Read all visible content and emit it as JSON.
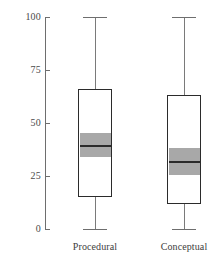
{
  "chart_data": {
    "type": "box",
    "title": "",
    "xlabel": "",
    "ylabel": "",
    "ylim": [
      0,
      100
    ],
    "grid": false,
    "legend": null,
    "categories": [
      "Procedural",
      "Conceptual"
    ],
    "y_ticks": [
      {
        "value": 100,
        "label": "100"
      },
      {
        "value": 75,
        "label": "75"
      },
      {
        "value": 50,
        "label": "50"
      },
      {
        "value": 25,
        "label": "25"
      },
      {
        "value": 0,
        "label": "0"
      }
    ],
    "boxes": [
      {
        "name": "Procedural",
        "whisker_low": 0,
        "q1": 15,
        "notch_low": 34,
        "median": 39.5,
        "notch_high": 45,
        "q3": 66,
        "whisker_high": 100
      },
      {
        "name": "Conceptual",
        "whisker_low": 0,
        "q1": 12,
        "notch_low": 25.5,
        "median": 32,
        "notch_high": 38,
        "q3": 63,
        "whisker_high": 100
      }
    ],
    "colors": {
      "box_fill": "#ffffff",
      "box_edge": "#2b2b2b",
      "notch_fill": "#a8a8a8",
      "median": "#2b2b2b",
      "whisker": "#7a7a7a",
      "axis": "#6e6e6e",
      "tick_label": "#4a4a4a",
      "background": "#ffffff"
    }
  }
}
